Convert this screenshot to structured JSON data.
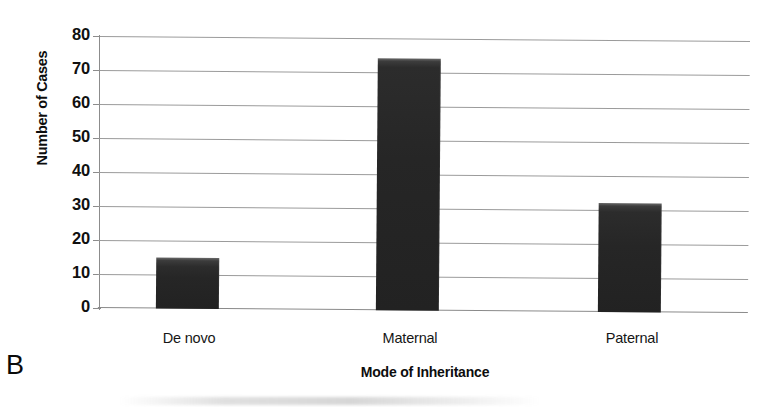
{
  "panel": {
    "letter": "B"
  },
  "axes": {
    "ylabel": "Number of Cases",
    "xlabel": "Mode of Inheritance",
    "yticks": [
      "80",
      "70",
      "60",
      "50",
      "40",
      "30",
      "20",
      "10",
      "0"
    ]
  },
  "chart_data": {
    "type": "bar",
    "title": "",
    "subtitle": "",
    "panel_label": "B",
    "categories": [
      "De novo",
      "Maternal",
      "Paternal"
    ],
    "values": [
      15,
      74,
      32
    ],
    "series": [
      {
        "name": "Number of Cases",
        "values": [
          15,
          74,
          32
        ]
      }
    ],
    "xlabel": "Mode of Inheritance",
    "ylabel": "Number of Cases",
    "ylim": [
      0,
      80
    ],
    "ytick_values": [
      0,
      10,
      20,
      30,
      40,
      50,
      60,
      70,
      80
    ],
    "ytick_labels": [
      "0",
      "10",
      "20",
      "30",
      "40",
      "50",
      "60",
      "70",
      "80"
    ],
    "grid": "horizontal",
    "legend": "none",
    "bar_color": "#262626",
    "gridline_color": "#9b9b9b",
    "background_color": "#ffffff",
    "annotations": []
  }
}
